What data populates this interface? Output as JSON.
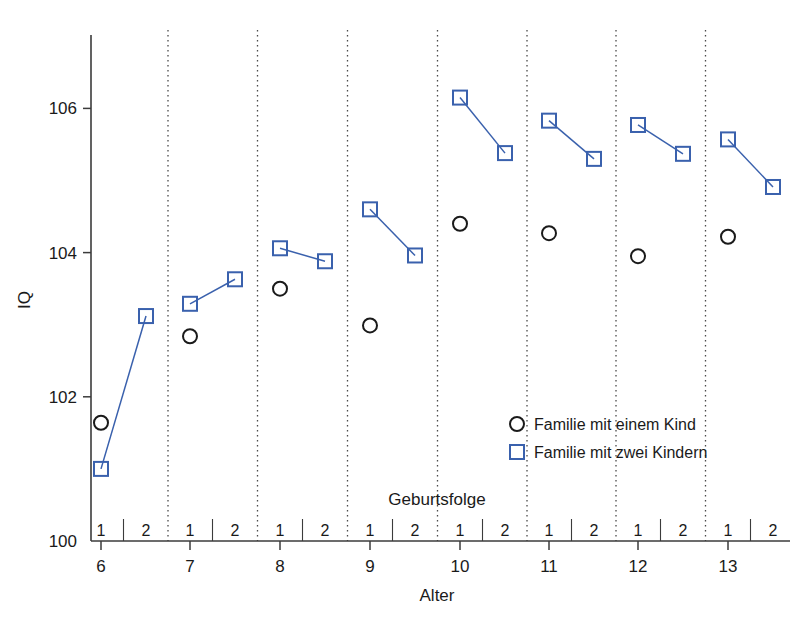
{
  "chart_data": {
    "type": "scatter",
    "title": "",
    "xlabel": "Alter",
    "ylabel": "IQ",
    "group_axis_label": "Geburtsfolge",
    "ylim": [
      100,
      107.2
    ],
    "yticks": [
      100,
      102,
      104,
      106
    ],
    "ytick_labels": [
      "100",
      "102",
      "104",
      "106"
    ],
    "xticks": [
      6,
      7,
      8,
      9,
      10,
      11,
      12,
      13
    ],
    "xtick_labels": [
      "6",
      "7",
      "8",
      "9",
      "10",
      "11",
      "12",
      "13"
    ],
    "birth_order_labels": [
      "1",
      "2"
    ],
    "grid": false,
    "group_separators": true,
    "legend_position": "inside-right",
    "colors": {
      "one_child": "#1a1a1a",
      "two_children": "#3a61ad",
      "axis": "#3b3b3b",
      "separator": "#4a4a4a",
      "background": "#ffffff"
    },
    "series": [
      {
        "name": "Familie mit einem Kind",
        "marker": "circle",
        "color": "#1a1a1a",
        "connected": false,
        "points": [
          {
            "age": 6,
            "birth_order": 1,
            "iq": 101.64
          },
          {
            "age": 7,
            "birth_order": 1,
            "iq": 102.84
          },
          {
            "age": 8,
            "birth_order": 1,
            "iq": 103.5
          },
          {
            "age": 9,
            "birth_order": 1,
            "iq": 102.99
          },
          {
            "age": 10,
            "birth_order": 1,
            "iq": 104.4
          },
          {
            "age": 11,
            "birth_order": 1,
            "iq": 104.27
          },
          {
            "age": 12,
            "birth_order": 1,
            "iq": 103.95
          },
          {
            "age": 13,
            "birth_order": 1,
            "iq": 104.22
          }
        ]
      },
      {
        "name": "Familie mit zwei Kindern",
        "marker": "square",
        "color": "#3a61ad",
        "connected": true,
        "points": [
          {
            "age": 6,
            "birth_order": 1,
            "iq": 101.0
          },
          {
            "age": 6,
            "birth_order": 2,
            "iq": 103.12
          },
          {
            "age": 7,
            "birth_order": 1,
            "iq": 103.29
          },
          {
            "age": 7,
            "birth_order": 2,
            "iq": 103.63
          },
          {
            "age": 8,
            "birth_order": 1,
            "iq": 104.06
          },
          {
            "age": 8,
            "birth_order": 2,
            "iq": 103.88
          },
          {
            "age": 9,
            "birth_order": 1,
            "iq": 104.6
          },
          {
            "age": 9,
            "birth_order": 2,
            "iq": 103.96
          },
          {
            "age": 10,
            "birth_order": 1,
            "iq": 106.15
          },
          {
            "age": 10,
            "birth_order": 2,
            "iq": 105.38
          },
          {
            "age": 11,
            "birth_order": 1,
            "iq": 105.83
          },
          {
            "age": 11,
            "birth_order": 2,
            "iq": 105.3
          },
          {
            "age": 12,
            "birth_order": 1,
            "iq": 105.77
          },
          {
            "age": 12,
            "birth_order": 2,
            "iq": 105.37
          },
          {
            "age": 13,
            "birth_order": 1,
            "iq": 105.57
          },
          {
            "age": 13,
            "birth_order": 2,
            "iq": 104.91
          }
        ]
      }
    ],
    "legend": [
      {
        "label": "Familie mit einem Kind",
        "marker": "circle",
        "color": "#1a1a1a"
      },
      {
        "label": "Familie mit zwei Kindern",
        "marker": "square",
        "color": "#3a61ad"
      }
    ]
  }
}
